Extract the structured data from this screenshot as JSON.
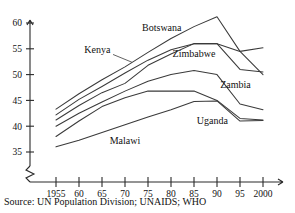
{
  "source_note": "Source: UN Population Division; UNAIDS; WHO",
  "labels": {
    "botswana": "Botswana",
    "kenya": "Kenya",
    "zimbabwe": "Zimbabwe",
    "zambia": "Zambia",
    "uganda": "Uganda",
    "malawi": "Malawi"
  },
  "axis": {
    "y_ticks": [
      "35",
      "40",
      "45",
      "50",
      "55",
      "60"
    ],
    "x_ticks": [
      "1955",
      "60",
      "65",
      "70",
      "75",
      "80",
      "85",
      "90",
      "95",
      "2000"
    ],
    "y_break": true
  },
  "colors": {
    "line": "#3a3a3a",
    "axis": "#2a2a2a",
    "background": "#ffffff",
    "text": "#111111"
  },
  "chart_data": {
    "type": "line",
    "title": "",
    "subtitle": "",
    "xlabel": "",
    "ylabel": "",
    "xlim": [
      1955,
      2000
    ],
    "ylim": [
      33,
      62
    ],
    "grid": false,
    "legend": "inline-annotations",
    "axis_break_below": 35,
    "x": [
      1955,
      1960,
      1965,
      1970,
      1975,
      1980,
      1985,
      1990,
      1995,
      2000
    ],
    "x_tick_labels": [
      "1955",
      "60",
      "65",
      "70",
      "75",
      "80",
      "85",
      "90",
      "95",
      "2000"
    ],
    "y_tick_values": [
      35,
      40,
      45,
      50,
      55,
      60
    ],
    "series": [
      {
        "name": "Botswana",
        "values": [
          43.3,
          46.3,
          49.0,
          51.5,
          54.3,
          57.0,
          59.3,
          61.2,
          54.5,
          50.0
        ]
      },
      {
        "name": "Kenya",
        "values": [
          42.2,
          45.2,
          47.7,
          50.3,
          52.8,
          54.8,
          56.0,
          56.0,
          54.5,
          55.2
        ]
      },
      {
        "name": "Zimbabwe",
        "values": [
          41.2,
          44.0,
          46.5,
          48.3,
          51.8,
          54.0,
          56.0,
          56.0,
          51.0,
          50.5
        ]
      },
      {
        "name": "Zambia",
        "values": [
          40.0,
          42.5,
          44.7,
          46.8,
          48.7,
          50.0,
          50.8,
          50.0,
          44.3,
          43.2
        ]
      },
      {
        "name": "Uganda",
        "values": [
          38.0,
          41.0,
          43.8,
          45.5,
          46.8,
          46.8,
          46.8,
          45.0,
          41.5,
          41.2
        ]
      },
      {
        "name": "Malawi",
        "values": [
          36.0,
          37.3,
          38.8,
          40.3,
          41.8,
          43.2,
          44.8,
          44.9,
          41.0,
          41.1
        ]
      }
    ],
    "annotations": [
      {
        "text": "Botswana",
        "x": 1978,
        "y": 58.5
      },
      {
        "text": "Kenya",
        "x": 1964,
        "y": 54.2
      },
      {
        "text": "Zimbabwe",
        "x": 1985,
        "y": 53.5
      },
      {
        "text": "Zambia",
        "x": 1994,
        "y": 47.5
      },
      {
        "text": "Uganda",
        "x": 1989,
        "y": 40.5
      },
      {
        "text": "Malawi",
        "x": 1970,
        "y": 36.6
      }
    ]
  }
}
